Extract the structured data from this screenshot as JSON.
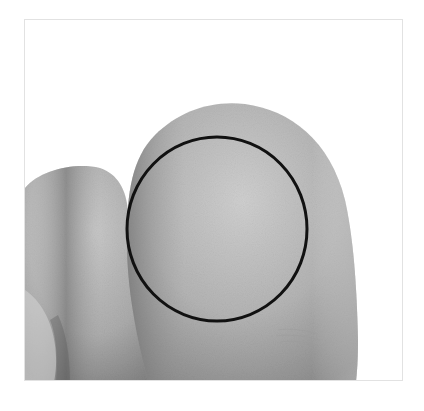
{
  "image": {
    "description": "Grayscale close-up photo of two fingertips (index and middle finger pads) with a black circle outlining a region on the right fingertip pad",
    "background_color": "#ffffff",
    "frame_border_color": "#e2e2e2",
    "skin_tone_light": "#c9c9c9",
    "skin_tone_mid": "#a9a9a9",
    "skin_tone_dark": "#6e6e6e",
    "annotation": {
      "shape": "circle",
      "stroke_color": "#111111",
      "stroke_width": 3,
      "cx": 217,
      "cy": 229,
      "rx": 90,
      "ry": 92
    }
  }
}
